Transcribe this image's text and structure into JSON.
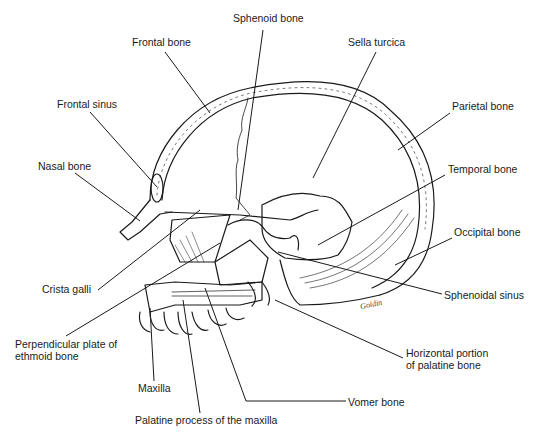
{
  "diagram": {
    "signature": "Goldin",
    "line_color": "#1a1a1a",
    "background": "#ffffff"
  },
  "labels": [
    {
      "id": "sphenoid-bone",
      "text": "Sphenoid bone",
      "x": 233,
      "y": 17,
      "leader": [
        [
          263,
          30
        ],
        [
          238,
          210
        ]
      ]
    },
    {
      "id": "frontal-bone",
      "text": "Frontal bone",
      "x": 132,
      "y": 38,
      "leader": [
        [
          165,
          52
        ],
        [
          210,
          113
        ]
      ]
    },
    {
      "id": "sella-turcica",
      "text": "Sella turcica",
      "x": 348,
      "y": 38,
      "leader": [
        [
          376,
          52
        ],
        [
          313,
          178
        ]
      ]
    },
    {
      "id": "frontal-sinus",
      "text": "Frontal sinus",
      "x": 57,
      "y": 98,
      "leader": [
        [
          90,
          112
        ],
        [
          157,
          187
        ]
      ]
    },
    {
      "id": "parietal-bone",
      "text": "Parietal bone",
      "x": 452,
      "y": 100,
      "leader": [
        [
          450,
          113
        ],
        [
          398,
          150
        ]
      ]
    },
    {
      "id": "nasal-bone",
      "text": "Nasal bone",
      "x": 38,
      "y": 160,
      "leader": [
        [
          75,
          173
        ],
        [
          140,
          221
        ]
      ]
    },
    {
      "id": "temporal-bone",
      "text": "Temporal bone",
      "x": 448,
      "y": 162,
      "leader": [
        [
          445,
          175
        ],
        [
          318,
          245
        ]
      ]
    },
    {
      "id": "occipital-bone",
      "text": "Occipital bone",
      "x": 454,
      "y": 225,
      "leader": [
        [
          452,
          238
        ],
        [
          395,
          265
        ]
      ]
    },
    {
      "id": "crista-galli",
      "text": "Crista galli",
      "x": 42,
      "y": 286,
      "leader": [
        [
          98,
          290
        ],
        [
          200,
          210
        ]
      ]
    },
    {
      "id": "sphenoidal-sinus",
      "text": "Sphenoidal sinus",
      "x": 444,
      "y": 290,
      "leader": [
        [
          442,
          294
        ],
        [
          278,
          252
        ]
      ]
    },
    {
      "id": "perpendicular-plate",
      "text": "Perpendicular plate of\nethmoid bone",
      "x": 15,
      "y": 338,
      "leader": [
        [
          66,
          336
        ],
        [
          220,
          243
        ]
      ]
    },
    {
      "id": "maxilla",
      "text": "Maxilla",
      "x": 138,
      "y": 383,
      "leader": [
        [
          154,
          381
        ],
        [
          150,
          308
        ]
      ]
    },
    {
      "id": "horizontal-palatine",
      "text": "Horizontal portion\nof palatine bone",
      "x": 406,
      "y": 346,
      "leader": [
        [
          403,
          358
        ],
        [
          275,
          300
        ]
      ]
    },
    {
      "id": "vomer-bone",
      "text": "Vomer bone",
      "x": 347,
      "y": 397,
      "leader": [
        [
          346,
          401
        ],
        [
          246,
          401
        ],
        [
          205,
          288
        ]
      ]
    },
    {
      "id": "palatine-process",
      "text": "Palatine process of the maxilla",
      "x": 135,
      "y": 415,
      "leader": [
        [
          200,
          413
        ],
        [
          183,
          300
        ]
      ]
    }
  ]
}
